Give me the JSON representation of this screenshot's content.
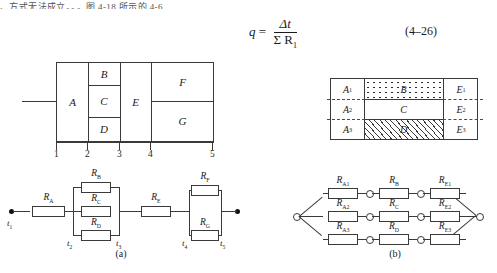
{
  "page": {
    "top_cut_text": "、方式无法成立。。。图 4-18 所示的 4-6",
    "equation": {
      "lhs": "q",
      "equals": "=",
      "numerator": "Δt",
      "denominator": "Σ R",
      "denominator_sub": "1",
      "number": "(4–26)"
    }
  },
  "figure_wall_a": {
    "name": "wall-cross-section-a",
    "regions": [
      "A",
      "B",
      "C",
      "D",
      "E",
      "F",
      "G"
    ],
    "scale_numbers": [
      "1",
      "2",
      "3",
      "4",
      "5"
    ]
  },
  "figure_wall_b": {
    "name": "wall-cross-section-b",
    "left_column": [
      "A1",
      "A2",
      "A3"
    ],
    "left_column_display": [
      "A",
      "A",
      "A"
    ],
    "left_subs": [
      "1",
      "2",
      "3"
    ],
    "middle": [
      "B",
      "C",
      "D"
    ],
    "right_column_display": [
      "E",
      "E",
      "E"
    ],
    "right_subs": [
      "1",
      "2",
      "3"
    ],
    "fill_B": "dotted-stipple",
    "fill_C": "plain",
    "fill_D": "diagonal-hatch"
  },
  "circuit_a": {
    "caption": "(a)",
    "series_1": {
      "base": "R",
      "sub": "A"
    },
    "parallel_1": [
      {
        "base": "R",
        "sub": "B"
      },
      {
        "base": "R",
        "sub": "C"
      },
      {
        "base": "R",
        "sub": "D"
      }
    ],
    "series_2": {
      "base": "R",
      "sub": "E"
    },
    "parallel_2": [
      {
        "base": "R",
        "sub": "F"
      },
      {
        "base": "R",
        "sub": "G"
      }
    ],
    "nodes": [
      {
        "base": "t",
        "sub": "1"
      },
      {
        "base": "t",
        "sub": "2"
      },
      {
        "base": "t",
        "sub": "3"
      },
      {
        "base": "t",
        "sub": "4"
      },
      {
        "base": "t",
        "sub": "5"
      }
    ]
  },
  "circuit_b": {
    "caption": "(b)",
    "branches": [
      [
        {
          "base": "R",
          "sub": "A1"
        },
        {
          "base": "R",
          "sub": "B"
        },
        {
          "base": "R",
          "sub": "E1"
        }
      ],
      [
        {
          "base": "R",
          "sub": "A2"
        },
        {
          "base": "R",
          "sub": "C"
        },
        {
          "base": "R",
          "sub": "E2"
        }
      ],
      [
        {
          "base": "R",
          "sub": "A3"
        },
        {
          "base": "R",
          "sub": "D"
        },
        {
          "base": "R",
          "sub": "E3"
        }
      ]
    ]
  },
  "colors": {
    "ink": "#1b1b1b",
    "line": "#3a3a3a",
    "dash": "#4a4a4a",
    "paper": "#ffffff"
  }
}
